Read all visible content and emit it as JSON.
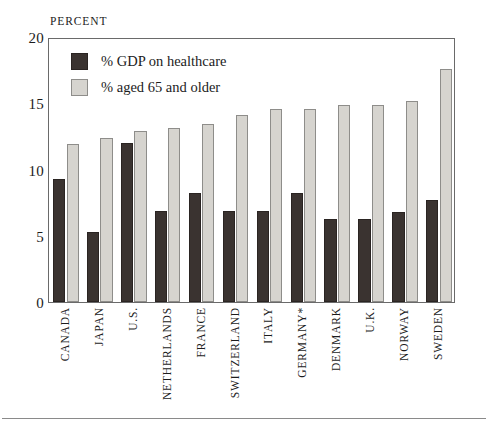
{
  "axis": {
    "unit_caption": "PERCENT",
    "y_ticks": [
      "20",
      "15",
      "10",
      "5",
      "0"
    ]
  },
  "legend": {
    "items": [
      {
        "label": "% GDP on healthcare",
        "swatch": "dark-swatch-icon",
        "color": "#3a3330"
      },
      {
        "label": "% aged 65 and older",
        "swatch": "light-swatch-icon",
        "color": "#d6d4cf"
      }
    ]
  },
  "chart_data": {
    "type": "bar",
    "title": "",
    "subtitle": "",
    "xlabel": "",
    "ylabel": "PERCENT",
    "ylim": [
      0,
      20
    ],
    "ytick_values": [
      0,
      5,
      10,
      15,
      20
    ],
    "grid": false,
    "legend_position": "top-left-inside",
    "categories": [
      "CANADA",
      "JAPAN",
      "U.S.",
      "NETHERLANDS",
      "FRANCE",
      "SWITZERLAND",
      "ITALY",
      "GERMANY*",
      "DENMARK",
      "U.K.",
      "NORWAY",
      "SWEDEN"
    ],
    "series": [
      {
        "name": "% GDP on healthcare",
        "color": "#3a3330",
        "values": [
          9.3,
          5.3,
          12.0,
          6.9,
          8.2,
          6.9,
          6.9,
          8.2,
          6.3,
          6.3,
          6.8,
          7.7
        ]
      },
      {
        "name": "% aged 65 and older",
        "color": "#d6d4cf",
        "values": [
          11.9,
          12.4,
          12.9,
          13.1,
          13.4,
          14.1,
          14.6,
          14.6,
          14.9,
          14.9,
          15.2,
          17.6
        ]
      }
    ],
    "annotations": [
      "GERMANY*"
    ]
  }
}
